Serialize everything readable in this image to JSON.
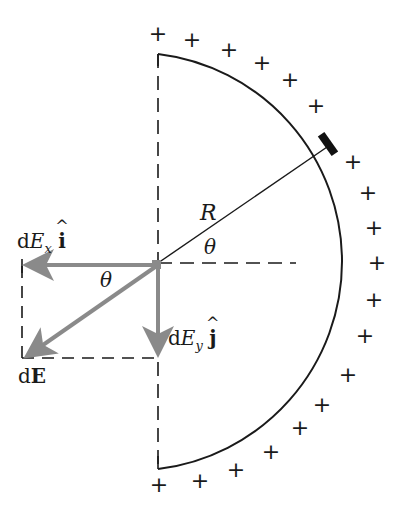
{
  "figure": {
    "colors": {
      "line": "#1a1a1a",
      "vector": "#8a8a8a",
      "background": "#ffffff"
    },
    "geometry": {
      "center": [
        158,
        263
      ],
      "radius": 209
    }
  },
  "labels": {
    "R": "R",
    "theta_arc": "θ",
    "theta_vector": "θ",
    "dEx_d": "d",
    "dEx_E": "E",
    "dEx_sub": "x",
    "dEx_unit": "i",
    "dEx_hat": "^",
    "dEy_d": "d",
    "dEy_E": "E",
    "dEy_sub": "y",
    "dEy_unit": "j",
    "dEy_hat": "^",
    "dE_d": "d",
    "dE_E": "E"
  },
  "charges": {
    "symbol": "+",
    "positions": [
      [
        158,
        34
      ],
      [
        192,
        40
      ],
      [
        229,
        50
      ],
      [
        262,
        63
      ],
      [
        290,
        80
      ],
      [
        316,
        106
      ],
      [
        353,
        162
      ],
      [
        368,
        193
      ],
      [
        374,
        228
      ],
      [
        377,
        263
      ],
      [
        374,
        300
      ],
      [
        365,
        336
      ],
      [
        348,
        375
      ],
      [
        322,
        405
      ],
      [
        300,
        428
      ],
      [
        271,
        452
      ],
      [
        236,
        470
      ],
      [
        200,
        481
      ],
      [
        159,
        485
      ]
    ]
  }
}
